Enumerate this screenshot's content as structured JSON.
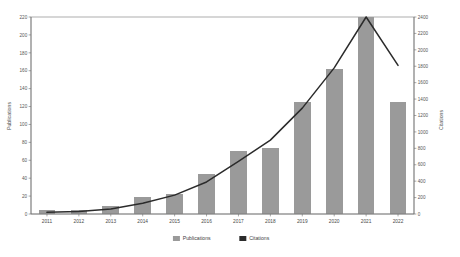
{
  "chart_data": {
    "type": "bar",
    "title": "",
    "subtitle": "",
    "xlabel": "",
    "ylabel": "Publications",
    "y2label": "Citations",
    "categories": [
      "2011",
      "2012",
      "2013",
      "2014",
      "2015",
      "2016",
      "2017",
      "2018",
      "2019",
      "2020",
      "2021",
      "2022"
    ],
    "ylim": [
      0,
      220
    ],
    "y2lim": [
      0,
      2400
    ],
    "yticks": [
      0,
      20,
      40,
      60,
      80,
      100,
      120,
      140,
      160,
      180,
      200,
      220
    ],
    "y2ticks": [
      0,
      200,
      400,
      600,
      800,
      1000,
      1200,
      1400,
      1600,
      1800,
      2000,
      2200,
      2400
    ],
    "grid": false,
    "legend_position": "bottom",
    "series": [
      {
        "name": "Publications",
        "kind": "bar",
        "axis": "left",
        "color": "#9a9a9a",
        "values": [
          5,
          5,
          9,
          19,
          22,
          45,
          70,
          74,
          125,
          162,
          220,
          125
        ]
      },
      {
        "name": "Citations",
        "kind": "line",
        "axis": "right",
        "color": "#2b2b2b",
        "values": [
          20,
          30,
          60,
          130,
          230,
          390,
          640,
          900,
          1290,
          1780,
          2400,
          1810
        ]
      }
    ]
  },
  "legend": {
    "items": [
      {
        "label": "Publications",
        "color": "#9a9a9a"
      },
      {
        "label": "Citations",
        "color": "#2b2b2b"
      }
    ]
  },
  "axes": {
    "left_title": "Publications",
    "right_title": "Citations"
  }
}
